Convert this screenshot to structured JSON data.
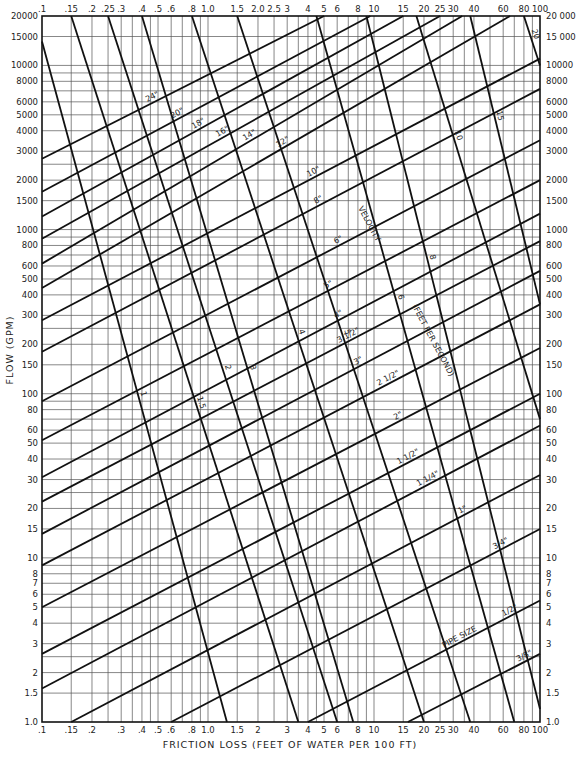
{
  "chart_data": {
    "type": "line",
    "title": "",
    "xlabel": "FRICTION LOSS (FEET OF WATER PER 100 FT)",
    "ylabel": "FLOW (GPM)",
    "xscale": "log",
    "yscale": "log",
    "xlim": [
      0.1,
      100
    ],
    "ylim": [
      1.0,
      20000
    ],
    "grid": true,
    "x_ticks": [
      ".1",
      ".15",
      ".2",
      ".25",
      ".3",
      ".4",
      ".5",
      ".6",
      ".8",
      "1.0",
      "1.5",
      "2.0",
      "2.5",
      "3",
      "4",
      "5",
      "6",
      "8",
      "10",
      "15",
      "20",
      "25",
      "30",
      "40",
      "60",
      "80",
      "100"
    ],
    "x_ticks_bottom": [
      ".1",
      ".15",
      ".2",
      ".3",
      ".4",
      ".5",
      ".6",
      ".8",
      "1.0",
      "1.5",
      "2",
      "3",
      "4",
      "5",
      "6",
      "8",
      "10",
      "15",
      "20",
      "25",
      "30",
      "40",
      "60",
      "80",
      "100"
    ],
    "y_ticks_left": [
      "1.0",
      "1.5",
      "2",
      "3",
      "4",
      "5",
      "6",
      "7",
      "8",
      "10",
      "15",
      "20",
      "30",
      "40",
      "50",
      "60",
      "80",
      "100",
      "150",
      "200",
      "300",
      "400",
      "500",
      "600",
      "800",
      "1000",
      "1500",
      "2000",
      "3000",
      "4000",
      "5000",
      "6000",
      "8000",
      "10000",
      "15000",
      "20000"
    ],
    "y_ticks_right": [
      "1.0",
      "1.5",
      "2",
      "3",
      "4",
      "5",
      "6",
      "7",
      "8",
      "10",
      "15",
      "20",
      "30",
      "40",
      "50",
      "60",
      "80",
      "100",
      "150",
      "200",
      "300",
      "400",
      "500",
      "600",
      "800",
      "1000",
      "1500",
      "2000",
      "3000",
      "4000",
      "5000",
      "6000",
      "8000",
      "10000",
      "15 000",
      "20 000"
    ],
    "pipe_size_label": "PIPE SIZE",
    "velocity_label": "VELOCITY (FEET PER SECOND)",
    "pipe_sizes": [
      {
        "label": "24\"",
        "points": [
          [
            0.1,
            2700
          ],
          [
            5.0,
            20000
          ]
        ]
      },
      {
        "label": "20\"",
        "points": [
          [
            0.1,
            1700
          ],
          [
            9.5,
            20000
          ]
        ]
      },
      {
        "label": "18\"",
        "points": [
          [
            0.1,
            1200
          ],
          [
            15,
            20000
          ]
        ]
      },
      {
        "label": "16\"",
        "points": [
          [
            0.1,
            880
          ],
          [
            25,
            20000
          ]
        ]
      },
      {
        "label": "14\"",
        "points": [
          [
            0.1,
            620
          ],
          [
            34,
            20000
          ]
        ]
      },
      {
        "label": "12\"",
        "points": [
          [
            0.1,
            440
          ],
          [
            66,
            20000
          ]
        ]
      },
      {
        "label": "10\"",
        "points": [
          [
            0.1,
            280
          ],
          [
            100,
            11000
          ]
        ]
      },
      {
        "label": "8\"",
        "points": [
          [
            0.1,
            180
          ],
          [
            100,
            7200
          ]
        ]
      },
      {
        "label": "6\"",
        "points": [
          [
            0.1,
            90
          ],
          [
            100,
            3500
          ]
        ]
      },
      {
        "label": "5\"",
        "points": [
          [
            0.1,
            52
          ],
          [
            100,
            2000
          ]
        ]
      },
      {
        "label": "4\"",
        "points": [
          [
            0.1,
            31
          ],
          [
            100,
            1250
          ]
        ]
      },
      {
        "label": "3 1/2\"",
        "points": [
          [
            0.1,
            22
          ],
          [
            100,
            850
          ]
        ]
      },
      {
        "label": "3\"",
        "points": [
          [
            0.1,
            14
          ],
          [
            100,
            560
          ]
        ]
      },
      {
        "label": "2 1/2\"",
        "points": [
          [
            0.1,
            9
          ],
          [
            100,
            350
          ]
        ]
      },
      {
        "label": "2\"",
        "points": [
          [
            0.1,
            5
          ],
          [
            100,
            190
          ]
        ]
      },
      {
        "label": "1 1/2\"",
        "points": [
          [
            0.1,
            2.6
          ],
          [
            100,
            100
          ]
        ]
      },
      {
        "label": "1 1/4\"",
        "points": [
          [
            0.1,
            1.6
          ],
          [
            100,
            64
          ]
        ]
      },
      {
        "label": "1\"",
        "points": [
          [
            0.15,
            1.0
          ],
          [
            100,
            32
          ]
        ]
      },
      {
        "label": "3/4\"",
        "points": [
          [
            0.6,
            1.0
          ],
          [
            100,
            15
          ]
        ]
      },
      {
        "label": "1/2\"",
        "points": [
          [
            4.0,
            1.0
          ],
          [
            100,
            5.5
          ]
        ]
      },
      {
        "label": "3/8\"",
        "points": [
          [
            16,
            1.0
          ],
          [
            100,
            2.6
          ]
        ]
      }
    ],
    "velocities": [
      {
        "label": "1",
        "points": [
          [
            0.1,
            14000
          ],
          [
            1.3,
            1.0
          ]
        ]
      },
      {
        "label": "1.5",
        "points": [
          [
            0.15,
            20000
          ],
          [
            3.5,
            1.0
          ]
        ]
      },
      {
        "label": "2",
        "points": [
          [
            0.25,
            20000
          ],
          [
            6.0,
            1.0
          ]
        ]
      },
      {
        "label": "3",
        "points": [
          [
            0.4,
            20000
          ],
          [
            7.5,
            1.0
          ]
        ]
      },
      {
        "label": "4",
        "points": [
          [
            0.8,
            20000
          ],
          [
            20,
            1.0
          ]
        ]
      },
      {
        "label": "5",
        "points": [
          [
            1.5,
            20000
          ],
          [
            38,
            1.0
          ]
        ]
      },
      {
        "label": "6",
        "points": [
          [
            4.5,
            20000
          ],
          [
            70,
            1.0
          ]
        ]
      },
      {
        "label": "8",
        "points": [
          [
            9.0,
            20000
          ],
          [
            100,
            1.2
          ]
        ]
      },
      {
        "label": "10",
        "points": [
          [
            18,
            20000
          ],
          [
            100,
            70
          ]
        ]
      },
      {
        "label": "15",
        "points": [
          [
            38,
            20000
          ],
          [
            100,
            350
          ]
        ]
      },
      {
        "label": "20",
        "points": [
          [
            80,
            20000
          ],
          [
            100,
            10000
          ]
        ]
      }
    ]
  },
  "axes": {
    "x_title": "FRICTION LOSS (FEET OF WATER PER 100 FT)",
    "y_title": "FLOW (GPM)"
  },
  "annotations": {
    "velocity": "VELOCITY",
    "fps": "(FEET PER SECOND)",
    "pipe_size": "PIPE SIZE"
  }
}
